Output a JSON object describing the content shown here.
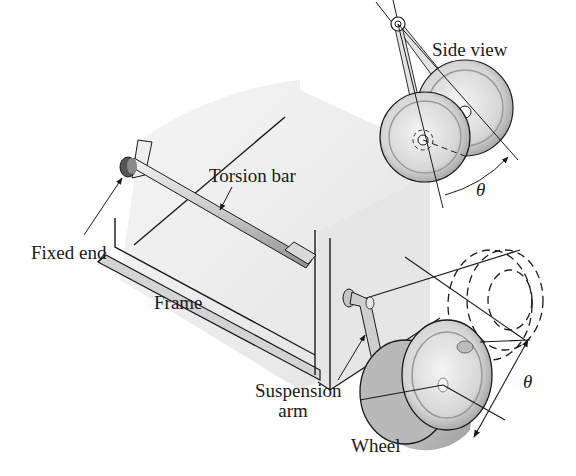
{
  "figure": {
    "labels": {
      "side_view": "Side view",
      "torsion_bar": "Torsion bar",
      "fixed_end": "Fixed end",
      "frame": "Frame",
      "suspension_arm_line1": "Suspension",
      "suspension_arm_line2": "arm",
      "wheel": "Wheel",
      "theta_side": "θ",
      "theta_main": "θ"
    },
    "colors": {
      "line": "#1a1a1a",
      "frame_face": "#e9e9e9",
      "frame_edge": "#d4d4d4",
      "wheel_face": "#dcdcdc",
      "wheel_shadow": "#a8a8a8",
      "bar": "#c8c8c8"
    }
  }
}
